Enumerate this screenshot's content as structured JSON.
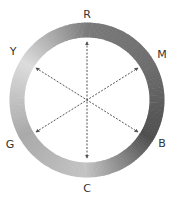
{
  "diagram": {
    "type": "color-wheel-complementary",
    "center": [
      87,
      100
    ],
    "ring": {
      "radius": 70,
      "stroke_width": 15,
      "gradient": [
        {
          "angle": 0,
          "label": "R",
          "color": "#7a7a7a"
        },
        {
          "angle": 60,
          "label": "M",
          "color": "#6e6e6e"
        },
        {
          "angle": 120,
          "label": "B",
          "color": "#4f4f4f"
        },
        {
          "angle": 180,
          "label": "C",
          "color": "#c4c4c4"
        },
        {
          "angle": 240,
          "label": "G",
          "color": "#a9a9a9"
        },
        {
          "angle": 300,
          "label": "Y",
          "color": "#dcdcdc"
        }
      ]
    },
    "labels": [
      {
        "id": "R",
        "text": "R",
        "x": 87,
        "y": 18
      },
      {
        "id": "M",
        "text": "M",
        "x": 162,
        "y": 58
      },
      {
        "id": "B",
        "text": "B",
        "x": 162,
        "y": 147
      },
      {
        "id": "C",
        "text": "C",
        "x": 87,
        "y": 192
      },
      {
        "id": "G",
        "text": "G",
        "x": 10,
        "y": 148
      },
      {
        "id": "Y",
        "text": "Y",
        "x": 13,
        "y": 55
      }
    ],
    "arrows": [
      {
        "from": "R",
        "to": "C",
        "x1": 87,
        "y1": 42,
        "x2": 87,
        "y2": 158
      },
      {
        "from": "Y",
        "to": "B",
        "x1": 36,
        "y1": 68,
        "x2": 138,
        "y2": 132
      },
      {
        "from": "G",
        "to": "M",
        "x1": 36,
        "y1": 132,
        "x2": 138,
        "y2": 68
      }
    ],
    "arrow_color": "#555555"
  }
}
